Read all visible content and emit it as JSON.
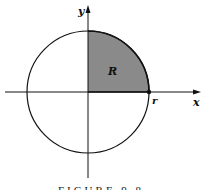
{
  "figure": {
    "caption": "FIGURE 9.8",
    "labels": {
      "y_axis": "y",
      "x_axis": "x",
      "region": "R",
      "radius_point": "r"
    },
    "colors": {
      "region_fill": "#8a8a8a",
      "stroke": "#111111",
      "background": "#ffffff"
    }
  }
}
